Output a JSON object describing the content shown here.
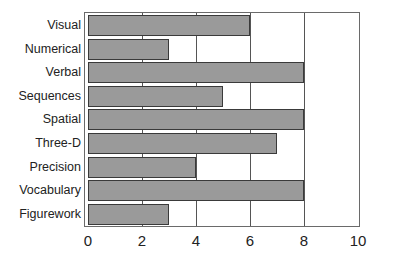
{
  "chart_data": {
    "type": "bar",
    "orientation": "horizontal",
    "title": "",
    "xlabel": "",
    "ylabel": "",
    "categories": [
      "Visual",
      "Numerical",
      "Verbal",
      "Sequences",
      "Spatial",
      "Three-D",
      "Precision",
      "Vocabulary",
      "Figurework"
    ],
    "values": [
      6,
      3,
      8,
      5,
      8,
      7,
      4,
      8,
      3
    ],
    "xlim": [
      0,
      10
    ],
    "xticks": [
      "0",
      "2",
      "4",
      "6",
      "8",
      "10"
    ],
    "grid": "vertical",
    "legend": null,
    "colors": {
      "bar_fill": "#9a9a9a",
      "bar_edge": "#3a3a3a",
      "grid": "#555555"
    }
  }
}
